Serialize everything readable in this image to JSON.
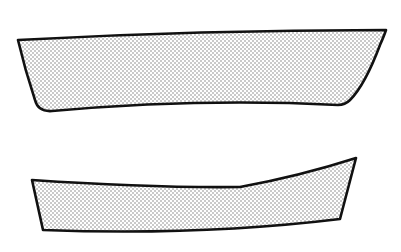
{
  "figure": {
    "background": "#ffffff",
    "stroke_color": "#111111",
    "fill_pattern": "stipple-dots",
    "dot_color": "#7a7a7a",
    "shapes": [
      {
        "id": "upper-curved-band",
        "description": "Stippled curved quadrilateral band, wider, upper",
        "corners": {
          "top_left": [
            18,
            40
          ],
          "top_right": [
            386,
            30
          ],
          "bottom_right": [
            343,
            105
          ],
          "bottom_left": [
            38,
            110
          ]
        }
      },
      {
        "id": "lower-curved-band",
        "description": "Stippled curved quadrilateral band, narrower, lower",
        "corners": {
          "top_left": [
            32,
            180
          ],
          "top_right": [
            356,
            158
          ],
          "bottom_right": [
            340,
            220
          ],
          "bottom_left": [
            43,
            231
          ]
        }
      }
    ]
  }
}
